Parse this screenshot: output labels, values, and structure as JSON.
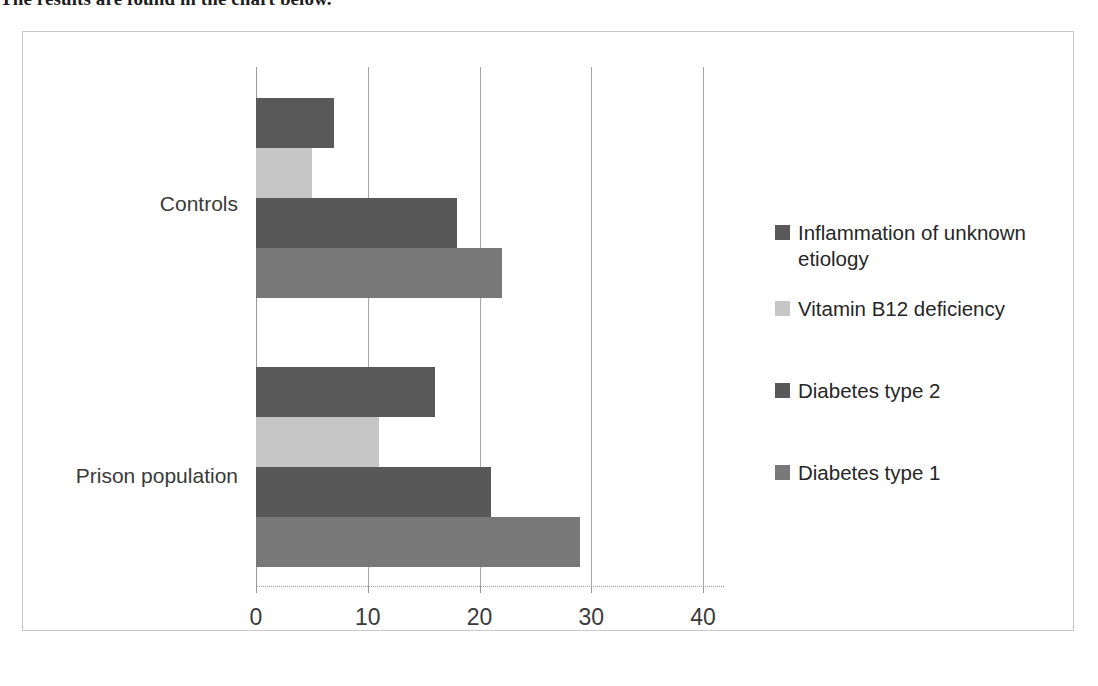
{
  "caption": {
    "text": "The results are found in the chart below."
  },
  "chart_data": {
    "type": "bar",
    "orientation": "horizontal",
    "title": "",
    "xlabel": "",
    "ylabel": "",
    "xlim": [
      0,
      40
    ],
    "grid": true,
    "legend_position": "right",
    "categories": [
      "Prison population",
      "Controls"
    ],
    "tick_labels": [
      "0",
      "10",
      "20",
      "30",
      "40"
    ],
    "tick_values": [
      0,
      10,
      20,
      30,
      40
    ],
    "series": [
      {
        "name": "Diabetes type 1",
        "color": "#787878",
        "values": [
          29,
          22
        ]
      },
      {
        "name": "Diabetes type 2",
        "color": "#585858",
        "values": [
          21,
          18
        ]
      },
      {
        "name": "Vitamin B12 deficiency",
        "color": "#c6c6c6",
        "values": [
          11,
          5
        ]
      },
      {
        "name": "Inflammation of unknown etiology",
        "color": "#595959",
        "values": [
          16,
          7
        ]
      }
    ]
  },
  "legend": {
    "items": [
      {
        "label": "Inflammation of unknown etiology",
        "color": "#595959"
      },
      {
        "label": "Vitamin B12 deficiency",
        "color": "#c6c6c6"
      },
      {
        "label": "Diabetes type 2",
        "color": "#585858"
      },
      {
        "label": "Diabetes type 1",
        "color": "#787878"
      }
    ]
  },
  "axis": {
    "category_labels": {
      "controls": "Controls",
      "prison": "Prison population"
    },
    "ticks": [
      "0",
      "10",
      "20",
      "30",
      "40"
    ]
  }
}
